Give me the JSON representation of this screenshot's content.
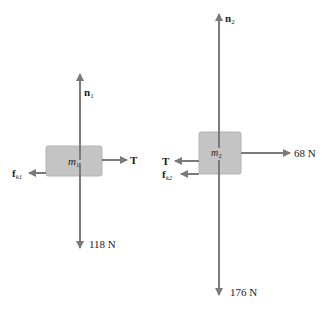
{
  "colors": {
    "arrow": "#7a7a7a",
    "box_fill": "#c4c4c4",
    "box_stroke": "#b0b0b0",
    "text": "#222222"
  },
  "block1": {
    "mass_label": "m",
    "mass_sub": "1",
    "forces": {
      "normal": {
        "label": "n",
        "sub": "1",
        "direction": "up"
      },
      "tension": {
        "label": "T",
        "direction": "right"
      },
      "friction": {
        "label": "f",
        "sub": "k1",
        "direction": "left"
      },
      "weight": {
        "label": "118 N",
        "direction": "down"
      }
    }
  },
  "block2": {
    "mass_label": "m",
    "mass_sub": "2",
    "forces": {
      "normal": {
        "label": "n",
        "sub": "2",
        "direction": "up"
      },
      "applied": {
        "label": "68 N",
        "direction": "right"
      },
      "tension": {
        "label": "T",
        "direction": "left"
      },
      "friction": {
        "label": "f",
        "sub": "k2",
        "direction": "left"
      },
      "weight": {
        "label": "176 N",
        "direction": "down"
      }
    }
  }
}
